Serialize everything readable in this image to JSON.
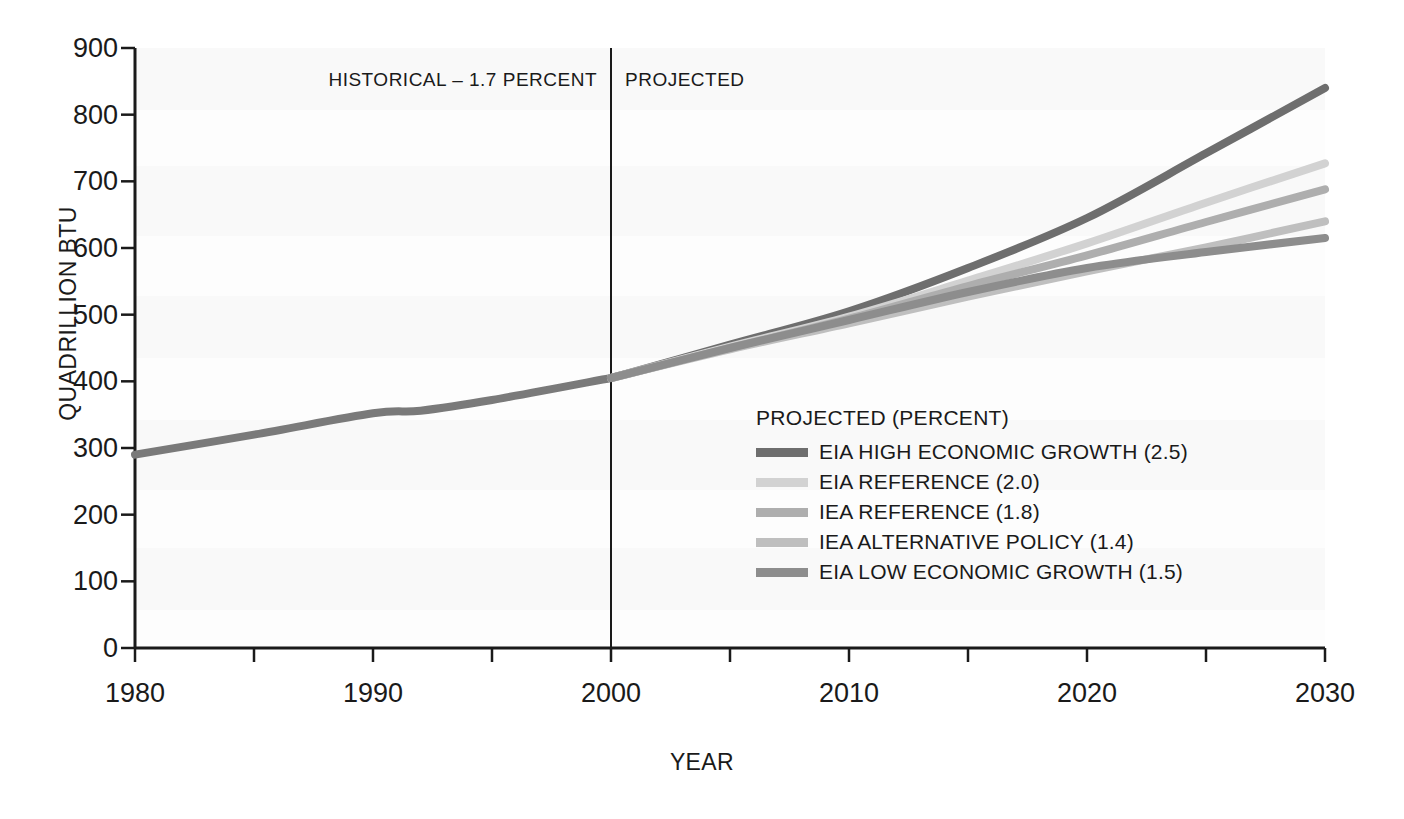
{
  "chart_data": {
    "type": "line",
    "title": "",
    "xlabel": "YEAR",
    "ylabel": "QUADRILLION BTU",
    "xlim": [
      1980,
      2030
    ],
    "ylim": [
      0,
      900
    ],
    "grid": false,
    "y_ticks": [
      900,
      800,
      700,
      600,
      500,
      400,
      300,
      200,
      100,
      0
    ],
    "x_ticks": [
      1980,
      1990,
      2000,
      2010,
      2020,
      2030
    ],
    "x_minor_ticks": [
      1985,
      1995,
      2005,
      2015,
      2025
    ],
    "legend_position": "inside-center-right",
    "legend_title": "PROJECTED (PERCENT)",
    "annotations": [
      {
        "name": "historical-label",
        "text": "HISTORICAL – 1.7 PERCENT"
      },
      {
        "name": "projected-label",
        "text": "PROJECTED"
      },
      {
        "name": "divider-year",
        "value": 2000
      }
    ],
    "series": [
      {
        "name": "HISTORICAL",
        "label": "HISTORICAL – 1.7 PERCENT",
        "color": "#7a7a7a",
        "x": [
          1980,
          1985,
          1990,
          1992,
          1995,
          2000
        ],
        "values": [
          290,
          320,
          352,
          356,
          372,
          405
        ]
      },
      {
        "name": "EIA HIGH ECONOMIC GROWTH (2.5)",
        "label": "EIA HIGH ECONOMIC GROWTH (2.5)",
        "color": "#6e6e6e",
        "x": [
          2000,
          2005,
          2010,
          2015,
          2020,
          2025,
          2030
        ],
        "values": [
          405,
          455,
          505,
          570,
          645,
          742,
          840
        ]
      },
      {
        "name": "EIA REFERENCE (2.0)",
        "label": "EIA REFERENCE (2.0)",
        "color": "#d2d2d2",
        "x": [
          2000,
          2005,
          2010,
          2015,
          2020,
          2025,
          2030
        ],
        "values": [
          405,
          452,
          497,
          551,
          607,
          668,
          727
        ]
      },
      {
        "name": "IEA REFERENCE (1.8)",
        "label": "IEA REFERENCE (1.8)",
        "color": "#aeaeae",
        "x": [
          2000,
          2005,
          2010,
          2015,
          2020,
          2025,
          2030
        ],
        "values": [
          405,
          450,
          494,
          543,
          589,
          639,
          688
        ]
      },
      {
        "name": "IEA ALTERNATIVE POLICY (1.4)",
        "label": "IEA ALTERNATIVE POLICY (1.4)",
        "color": "#bfbfbf",
        "x": [
          2000,
          2005,
          2010,
          2015,
          2020,
          2025,
          2030
        ],
        "values": [
          405,
          448,
          487,
          527,
          565,
          601,
          640
        ]
      },
      {
        "name": "EIA LOW ECONOMIC GROWTH (1.5)",
        "label": "EIA LOW ECONOMIC GROWTH (1.5)",
        "color": "#8d8d8d",
        "x": [
          2000,
          2005,
          2010,
          2015,
          2020,
          2025,
          2030
        ],
        "values": [
          405,
          450,
          492,
          534,
          570,
          594,
          615
        ]
      }
    ]
  },
  "axes": {
    "y_title": "QUADRILLION BTU",
    "x_title": "YEAR",
    "y_tick_labels": [
      "900",
      "800",
      "700",
      "600",
      "500",
      "400",
      "300",
      "200",
      "100",
      "0"
    ],
    "x_tick_labels": [
      "1980",
      "1990",
      "2000",
      "2010",
      "2020",
      "2030"
    ]
  },
  "annotations": {
    "historical": "HISTORICAL – 1.7 PERCENT",
    "projected": "PROJECTED"
  },
  "legend": {
    "title": "PROJECTED (PERCENT)",
    "items": [
      {
        "label": "EIA HIGH ECONOMIC GROWTH (2.5)",
        "color": "#6e6e6e"
      },
      {
        "label": "EIA REFERENCE (2.0)",
        "color": "#d2d2d2"
      },
      {
        "label": "IEA REFERENCE (1.8)",
        "color": "#aeaeae"
      },
      {
        "label": "IEA ALTERNATIVE POLICY (1.4)",
        "color": "#bfbfbf"
      },
      {
        "label": "EIA LOW ECONOMIC GROWTH (1.5)",
        "color": "#8d8d8d"
      }
    ]
  },
  "colors": {
    "axis": "#1a1a1a",
    "background": "#ffffff",
    "band": "#f4f4f4"
  }
}
